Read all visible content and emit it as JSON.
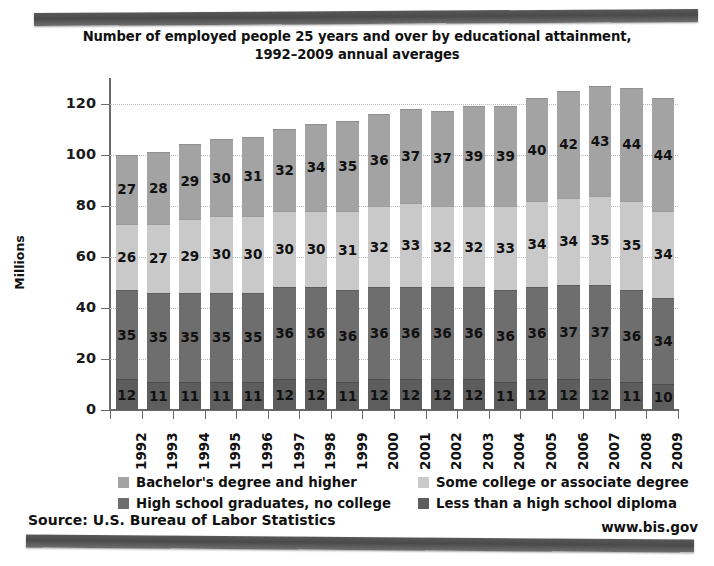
{
  "chart_data": {
    "type": "bar",
    "subtype": "stacked-bar",
    "title": "Number of employed people 25 years and over by educational attainment,",
    "title_line2": "1992–2009 annual averages",
    "xlabel": "",
    "ylabel": "Millions",
    "ylim": [
      0,
      130
    ],
    "yticks": [
      0,
      20,
      40,
      60,
      80,
      100,
      120
    ],
    "grid": true,
    "legend_position": "bottom",
    "categories": [
      "1992",
      "1993",
      "1994",
      "1995",
      "1996",
      "1997",
      "1998",
      "1999",
      "2000",
      "2001",
      "2002",
      "2003",
      "2004",
      "2005",
      "2006",
      "2007",
      "2008",
      "2009"
    ],
    "series": [
      {
        "name": "Less than a high school diploma",
        "color": "#5d5d5d",
        "stack_order": 1,
        "values": [
          12,
          11,
          11,
          11,
          11,
          12,
          12,
          11,
          12,
          12,
          12,
          12,
          11,
          12,
          12,
          12,
          11,
          10
        ]
      },
      {
        "name": "High school graduates, no college",
        "color": "#6e6e6e",
        "stack_order": 2,
        "values": [
          35,
          35,
          35,
          35,
          35,
          36,
          36,
          36,
          36,
          36,
          36,
          36,
          36,
          36,
          37,
          37,
          36,
          34
        ]
      },
      {
        "name": "Some college or associate degree",
        "color": "#c9c9c9",
        "stack_order": 3,
        "values": [
          26,
          27,
          29,
          30,
          30,
          30,
          30,
          31,
          32,
          33,
          32,
          32,
          33,
          34,
          34,
          35,
          35,
          34
        ]
      },
      {
        "name": "Bachelor's degree and higher",
        "color": "#a3a3a3",
        "stack_order": 4,
        "values": [
          27,
          28,
          29,
          30,
          31,
          32,
          34,
          35,
          36,
          37,
          37,
          39,
          39,
          40,
          42,
          43,
          44,
          44
        ]
      }
    ],
    "totals": [
      100,
      101,
      104,
      106,
      107,
      110,
      112,
      113,
      116,
      118,
      117,
      119,
      119,
      122,
      125,
      127,
      126,
      122
    ]
  },
  "legend": {
    "items": [
      {
        "label": "Bachelor's degree and higher",
        "color": "#a3a3a3"
      },
      {
        "label": "Some college or associate degree",
        "color": "#c9c9c9"
      },
      {
        "label": "High school graduates, no college",
        "color": "#6e6e6e"
      },
      {
        "label": "Less than a high school diploma",
        "color": "#5d5d5d"
      }
    ]
  },
  "footer": {
    "source": "Source: U.S. Bureau of Labor Statistics",
    "url": "www.bis.gov"
  }
}
